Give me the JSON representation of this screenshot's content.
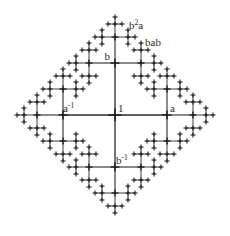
{
  "figure": {
    "type": "cayley-graph",
    "generators": [
      "a",
      "b"
    ],
    "background_color": "#ffffff",
    "line_color": "#2b2b2b",
    "label_color": "#2a2a2a",
    "center": {
      "x": 115,
      "y": 115
    },
    "level_lengths": [
      52,
      26,
      13,
      7
    ],
    "node_sizes": [
      13,
      9,
      7,
      5
    ],
    "depth": 4
  },
  "labels": [
    {
      "id": "identity",
      "base": "1",
      "sup": "",
      "x": 118,
      "y": 112,
      "anchor": "start"
    },
    {
      "id": "a",
      "base": "a",
      "sup": "",
      "x": 170,
      "y": 112,
      "anchor": "start"
    },
    {
      "id": "a-inverse",
      "base": "a",
      "sup": "-1",
      "x": 63,
      "y": 112,
      "anchor": "start"
    },
    {
      "id": "b",
      "base": "b",
      "sup": "",
      "x": 110,
      "y": 60,
      "anchor": "end"
    },
    {
      "id": "b-inverse",
      "base": "b",
      "sup": "-1",
      "x": 116,
      "y": 164,
      "anchor": "start"
    },
    {
      "id": "b2a",
      "base": "b",
      "sup": "2",
      "x": 129,
      "y": 29,
      "anchor": "start",
      "tail": "a"
    },
    {
      "id": "bab",
      "base": "bab",
      "sup": "",
      "x": 145,
      "y": 46,
      "anchor": "start"
    }
  ],
  "label_text": {
    "identity": "1",
    "a": "a",
    "a_inverse": "a⁻¹",
    "b": "b",
    "b_inverse": "b⁻¹",
    "b2a": "b²a",
    "bab": "bab"
  }
}
